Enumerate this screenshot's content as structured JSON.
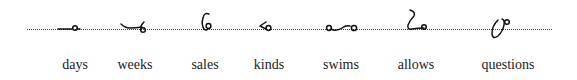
{
  "entries": [
    {
      "word": "days",
      "glyph": "days-outline-icon"
    },
    {
      "word": "weeks",
      "glyph": "weeks-outline-icon"
    },
    {
      "word": "sales",
      "glyph": "sales-outline-icon"
    },
    {
      "word": "kinds",
      "glyph": "kinds-outline-icon"
    },
    {
      "word": "swims",
      "glyph": "swims-outline-icon"
    },
    {
      "word": "allows",
      "glyph": "allows-outline-icon"
    },
    {
      "word": "questions",
      "glyph": "questions-outline-icon"
    }
  ],
  "colors": {
    "ink": "#111111",
    "line": "#444444",
    "text": "#222222",
    "background": "#ffffff"
  }
}
